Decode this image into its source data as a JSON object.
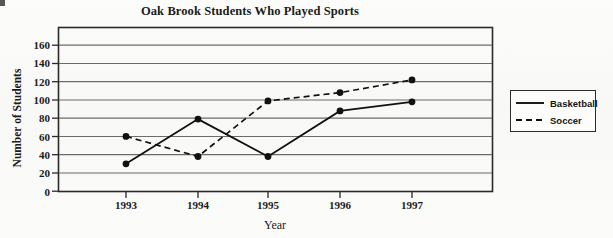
{
  "chart_data": {
    "type": "line",
    "title": "Oak Brook Students Who Played Sports",
    "xlabel": "Year",
    "ylabel": "Number of Students",
    "categories": [
      "1993",
      "1994",
      "1995",
      "1996",
      "1997"
    ],
    "x": [
      1993,
      1994,
      1995,
      1996,
      1997
    ],
    "series": [
      {
        "name": "Basketball",
        "style": "solid",
        "marker": "filled-circle",
        "color": "#111111",
        "values": [
          30,
          79,
          38,
          88,
          98
        ]
      },
      {
        "name": "Soccer",
        "style": "dashed",
        "marker": "filled-circle",
        "color": "#111111",
        "values": [
          60,
          38,
          99,
          108,
          122
        ]
      }
    ],
    "ylim": [
      0,
      170
    ],
    "yticks": [
      0,
      20,
      40,
      60,
      80,
      100,
      120,
      140,
      160
    ],
    "ytick_labels": [
      "0",
      "20",
      "40",
      "60",
      "80",
      "100",
      "120",
      "140",
      "160"
    ],
    "xtick_labels": [
      "1993",
      "1994",
      "1995",
      "1996",
      "1997"
    ],
    "grid": "horizontal",
    "legend_position": "right-outside",
    "legend_entries": [
      "Basketball",
      "Soccer"
    ]
  },
  "legend": {
    "basketball_label": "Basketball",
    "soccer_label": "Soccer"
  },
  "colors": {
    "ink": "#111111",
    "gridline": "#6b6b6b",
    "frame": "#2a2a2a",
    "page_background": "#fbfbfa"
  }
}
